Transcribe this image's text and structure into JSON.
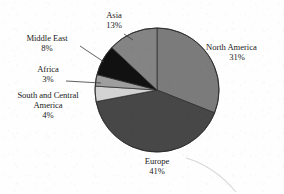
{
  "chart_data": {
    "type": "pie",
    "title": "",
    "subtitle": "",
    "xlabel": "",
    "ylabel": "",
    "units": "percent",
    "legend_position": "none",
    "labels_placement": "outside-with-leader-lines",
    "grid": false,
    "start_angle_deg": 0,
    "direction": "clockwise",
    "categories": [
      "North America",
      "Europe",
      "South and Central America",
      "Africa",
      "Middle East",
      "Asia"
    ],
    "values": [
      31,
      41,
      4,
      3,
      8,
      13
    ],
    "value_labels": [
      "31%",
      "41%",
      "4%",
      "3%",
      "8%",
      "13%"
    ],
    "total": 100,
    "slices": [
      {
        "name": "North America",
        "value": 31,
        "value_label": "31%",
        "color": "#7b7b7b",
        "start_deg": 0,
        "end_deg": 111.6,
        "label_line1": "North America",
        "label_line2": "31%"
      },
      {
        "name": "Europe",
        "value": 41,
        "value_label": "41%",
        "color": "#474747",
        "start_deg": 111.6,
        "end_deg": 259.2,
        "label_line1": "Europe",
        "label_line2": "41%"
      },
      {
        "name": "South and Central America",
        "value": 4,
        "value_label": "4%",
        "color": "#d3d3d3",
        "start_deg": 259.2,
        "end_deg": 273.6,
        "label_line1": "South and Central",
        "label_line2": "America",
        "label_line3": "4%"
      },
      {
        "name": "Africa",
        "value": 3,
        "value_label": "3%",
        "color": "#9e9e9e",
        "start_deg": 273.6,
        "end_deg": 284.4,
        "label_line1": "Africa",
        "label_line2": "3%"
      },
      {
        "name": "Middle East",
        "value": 8,
        "value_label": "8%",
        "color": "#111111",
        "start_deg": 284.4,
        "end_deg": 313.2,
        "label_line1": "Middle East",
        "label_line2": "8%"
      },
      {
        "name": "Asia",
        "value": 13,
        "value_label": "13%",
        "color": "#848484",
        "start_deg": 313.2,
        "end_deg": 360,
        "label_line1": "Asia",
        "label_line2": "13%"
      }
    ]
  },
  "labels": {
    "north_america": {
      "name": "North America",
      "value": "31%"
    },
    "europe": {
      "name": "Europe",
      "value": "41%"
    },
    "south_central": {
      "name_line1": "South and Central",
      "name_line2": "America",
      "value": "4%"
    },
    "africa": {
      "name": "Africa",
      "value": "3%"
    },
    "middle_east": {
      "name": "Middle East",
      "value": "8%"
    },
    "asia": {
      "name": "Asia",
      "value": "13%"
    }
  },
  "colors": {
    "north_america": "#7b7b7b",
    "europe": "#474747",
    "south_central": "#d3d3d3",
    "africa": "#9e9e9e",
    "middle_east": "#111111",
    "asia": "#848484",
    "outline": "#2a2a2a",
    "text": "#1a1a1a",
    "background": "#fefefe"
  }
}
